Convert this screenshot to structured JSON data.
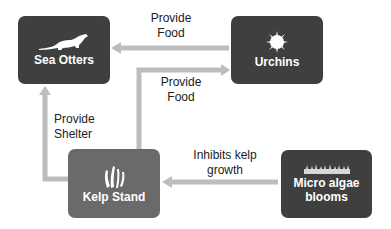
{
  "nodes": {
    "sea_otters": {
      "label": "Sea Otters",
      "icon": "otter-icon"
    },
    "urchins": {
      "label": "Urchins",
      "icon": "urchin-icon"
    },
    "kelp_stand": {
      "label": "Kelp Stand",
      "icon": "kelp-icon"
    },
    "micro_algae": {
      "label": "Micro algae blooms",
      "label_line1": "Micro algae",
      "label_line2": "blooms",
      "icon": "algae-icon"
    }
  },
  "edges": {
    "urchins_to_otters": {
      "line1": "Provide",
      "line2": "Food"
    },
    "kelp_to_urchins": {
      "line1": "Provide",
      "line2": "Food"
    },
    "kelp_to_otters": {
      "line1": "Provide",
      "line2": "Shelter"
    },
    "algae_to_kelp": {
      "line1": "Inhibits kelp",
      "line2": "growth"
    }
  },
  "colors": {
    "dark_node": "#3f3f3f",
    "kelp_node": "#6a6a6a",
    "arrow": "#bdbdbd"
  }
}
